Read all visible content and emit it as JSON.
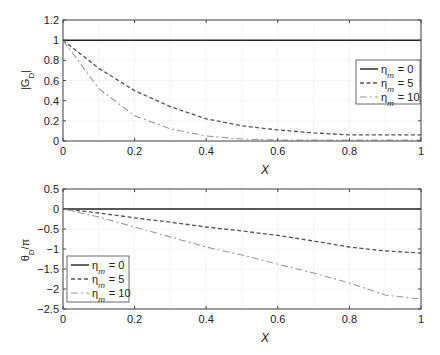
{
  "chart_data": [
    {
      "type": "line",
      "title": "",
      "xlabel": "X",
      "ylabel": "|G_D|",
      "xlim": [
        0,
        1
      ],
      "ylim": [
        0,
        1.2
      ],
      "xticks": [
        "0",
        "0.2",
        "0.4",
        "0.6",
        "0.8",
        "1"
      ],
      "yticks": [
        "0",
        "0.2",
        "0.4",
        "0.6",
        "0.8",
        "1",
        "1.2"
      ],
      "grid": true,
      "legend_position": "right",
      "x": [
        0,
        0.1,
        0.2,
        0.3,
        0.4,
        0.5,
        0.6,
        0.7,
        0.8,
        0.9,
        1.0
      ],
      "series": [
        {
          "name": "η_m = 0",
          "style": "solid",
          "values": [
            1,
            1,
            1,
            1,
            1,
            1,
            1,
            1,
            1,
            1,
            1
          ]
        },
        {
          "name": "η_m = 5",
          "style": "dashed",
          "values": [
            1,
            0.72,
            0.5,
            0.34,
            0.22,
            0.15,
            0.11,
            0.08,
            0.06,
            0.06,
            0.06
          ]
        },
        {
          "name": "η_m = 10",
          "style": "dashdot",
          "values": [
            1,
            0.52,
            0.25,
            0.12,
            0.05,
            0.02,
            0.01,
            0.01,
            0.01,
            0.01,
            0.01
          ]
        }
      ]
    },
    {
      "type": "line",
      "title": "",
      "xlabel": "X",
      "ylabel": "θ_D/π",
      "xlim": [
        0,
        1
      ],
      "ylim": [
        -2.5,
        0.5
      ],
      "xticks": [
        "0",
        "0.2",
        "0.4",
        "0.6",
        "0.8",
        "1"
      ],
      "yticks": [
        "-2.5",
        "-2",
        "-1.5",
        "-1",
        "-0.5",
        "0",
        "0.5"
      ],
      "grid": true,
      "legend_position": "lower left",
      "x": [
        0,
        0.1,
        0.2,
        0.3,
        0.4,
        0.5,
        0.6,
        0.7,
        0.8,
        0.9,
        1.0
      ],
      "series": [
        {
          "name": "η_m = 0",
          "style": "solid",
          "values": [
            0,
            0,
            0,
            0,
            0,
            0,
            0,
            0,
            0,
            0,
            0
          ]
        },
        {
          "name": "η_m = 5",
          "style": "dashed",
          "values": [
            0,
            -0.1,
            -0.22,
            -0.33,
            -0.45,
            -0.55,
            -0.66,
            -0.8,
            -0.95,
            -1.05,
            -1.1
          ]
        },
        {
          "name": "η_m = 10",
          "style": "dashdot",
          "values": [
            0,
            -0.2,
            -0.45,
            -0.7,
            -0.95,
            -1.15,
            -1.38,
            -1.6,
            -1.85,
            -2.15,
            -2.25
          ]
        }
      ]
    }
  ],
  "legend": {
    "symbol": "η",
    "subscript": "m",
    "entries": [
      "0",
      "5",
      "10"
    ]
  },
  "colors": {
    "eta0": "#222222",
    "eta5": "#555555",
    "eta10": "#999999",
    "grid": "#dddddd",
    "axis": "#444444"
  }
}
